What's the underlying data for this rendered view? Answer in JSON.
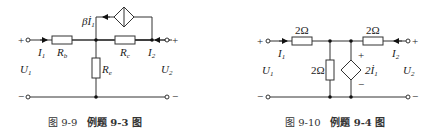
{
  "figures": [
    {
      "id": "fig-9-9",
      "caption": {
        "fig_no": "图 9-9",
        "title": "例题 9-3 图"
      },
      "components": {
        "rb": {
          "label": "R",
          "sub": "b"
        },
        "rc": {
          "label": "R",
          "sub": "c"
        },
        "re": {
          "label": "R",
          "sub": "e"
        },
        "dep_source": {
          "label": "βİ",
          "sub": "1",
          "type": "current-controlled current source"
        }
      },
      "ports": {
        "u1": {
          "label": "U",
          "sub": "1"
        },
        "u2": {
          "label": "U",
          "sub": "2"
        },
        "i1": {
          "label": "I",
          "sub": "1"
        },
        "i2": {
          "label": "I",
          "sub": "2"
        },
        "plus": "+",
        "minus": "−"
      }
    },
    {
      "id": "fig-9-10",
      "caption": {
        "fig_no": "图 9-10",
        "title": "例题 9-4 图"
      },
      "components": {
        "r_left": {
          "label": "2Ω"
        },
        "r_right": {
          "label": "2Ω"
        },
        "r_shunt": {
          "label": "2Ω"
        },
        "dep_source": {
          "label": "2İ",
          "sub": "1",
          "type": "current-controlled voltage source",
          "plus": "+",
          "minus": "−"
        }
      },
      "ports": {
        "u1": {
          "label": "U",
          "sub": "1"
        },
        "u2": {
          "label": "U",
          "sub": "2"
        },
        "i1": {
          "label": "I",
          "sub": "1"
        },
        "i2": {
          "label": "I",
          "sub": "2"
        },
        "plus": "+",
        "minus": "−"
      }
    }
  ]
}
